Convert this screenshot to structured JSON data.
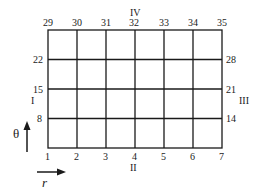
{
  "grid": {
    "columns": 6,
    "rows": 4,
    "line_color": "#1a1a1a",
    "bottom_labels": [
      "1",
      "2",
      "3",
      "4",
      "5",
      "6",
      "7"
    ],
    "top_labels": [
      "29",
      "30",
      "31",
      "32",
      "33",
      "34",
      "35"
    ],
    "left_labels": [
      "8",
      "15",
      "22"
    ],
    "right_labels": [
      "14",
      "21",
      "28"
    ]
  },
  "boundaries": {
    "left": "I",
    "bottom": "II",
    "right": "III",
    "top": "IV"
  },
  "axes": {
    "theta_label": "θ",
    "r_label": "r"
  }
}
